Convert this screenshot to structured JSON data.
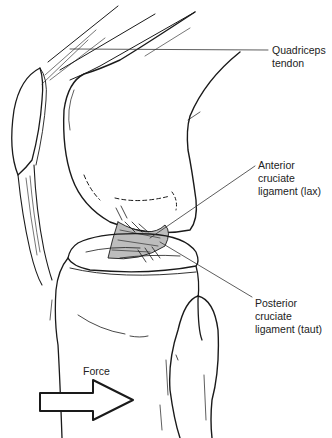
{
  "figure": {
    "labels": {
      "quadriceps_tendon": "Quadriceps\ntendon",
      "anterior_cruciate": "Anterior\ncruciate\nligament (lax)",
      "posterior_cruciate": "Posterior\ncruciate\nligament (taut)",
      "force": "Force"
    },
    "colors": {
      "line": "#1a1a1a",
      "ligament_fill": "#bdbdbd",
      "background": "#ffffff"
    },
    "arrow": {
      "direction": "right",
      "icon": "arrow-right-icon"
    }
  }
}
